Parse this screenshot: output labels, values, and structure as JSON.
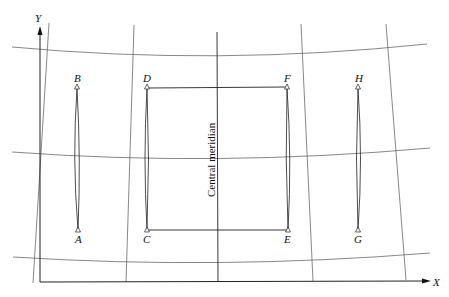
{
  "figure": {
    "type": "map projection grid diagram",
    "axes": {
      "x_label": "X",
      "y_label": "Y"
    },
    "central_meridian_label": "Central meridian",
    "points": [
      {
        "id": "A",
        "x": 78,
        "y": 230
      },
      {
        "id": "B",
        "x": 77,
        "y": 88
      },
      {
        "id": "C",
        "x": 147,
        "y": 230
      },
      {
        "id": "D",
        "x": 147,
        "y": 88
      },
      {
        "id": "E",
        "x": 288,
        "y": 230
      },
      {
        "id": "F",
        "x": 287,
        "y": 88
      },
      {
        "id": "G",
        "x": 358,
        "y": 230
      },
      {
        "id": "H",
        "x": 358,
        "y": 88
      }
    ],
    "point_labels": {
      "A": "A",
      "B": "B",
      "C": "C",
      "D": "D",
      "E": "E",
      "F": "F",
      "G": "G",
      "H": "H"
    },
    "meridian_count": 5,
    "parallel_count": 3,
    "colors": {
      "line": "#222222",
      "grid": "#555555",
      "background": "#ffffff"
    }
  }
}
